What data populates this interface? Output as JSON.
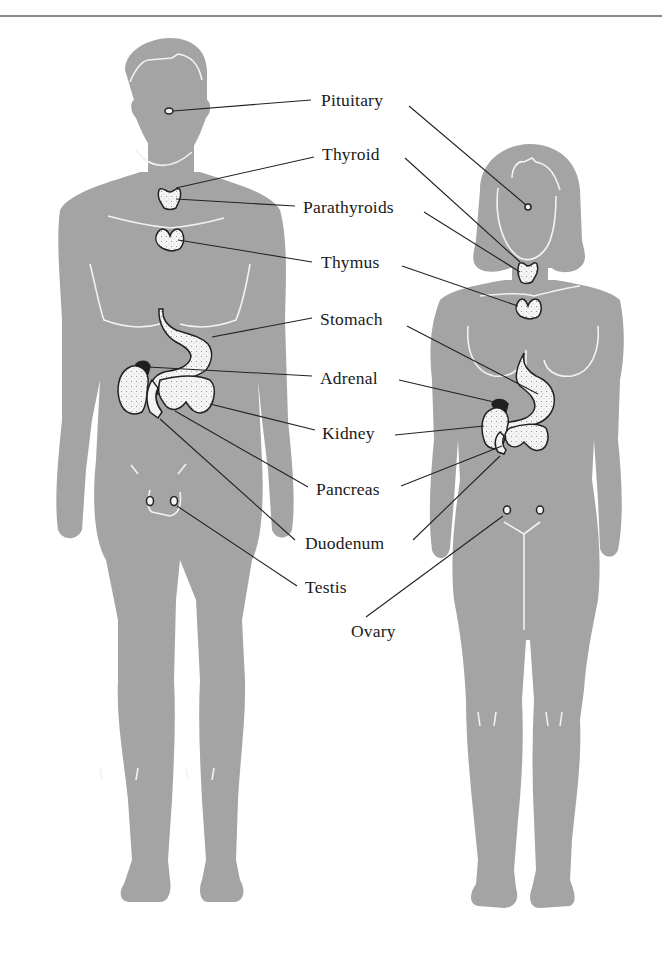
{
  "figure": {
    "figures": [
      "male",
      "female"
    ],
    "silhouette_color": "#a4a4a4",
    "organ_fill": "#f4f4f4",
    "line_color": "#222222"
  },
  "labels": [
    {
      "id": "pituitary",
      "text": "Pituitary",
      "x": 321,
      "y": 64
    },
    {
      "id": "thyroid",
      "text": "Thyroid",
      "x": 322,
      "y": 145
    },
    {
      "id": "parathyroids",
      "text": "Parathyroids",
      "x": 303,
      "y": 200
    },
    {
      "id": "thymus",
      "text": "Thymus",
      "x": 321,
      "y": 254
    },
    {
      "id": "stomach",
      "text": "Stomach",
      "x": 320,
      "y": 311
    },
    {
      "id": "adrenal",
      "text": "Adrenal",
      "x": 320,
      "y": 370
    },
    {
      "id": "kidney",
      "text": "Kidney",
      "x": 322,
      "y": 425
    },
    {
      "id": "pancreas",
      "text": "Pancreas",
      "x": 316,
      "y": 481
    },
    {
      "id": "duodenum",
      "text": "Duodenum",
      "x": 305,
      "y": 537
    },
    {
      "id": "testis",
      "text": "Testis",
      "x": 305,
      "y": 583
    },
    {
      "id": "ovary",
      "text": "Ovary",
      "x": 351,
      "y": 623
    }
  ]
}
